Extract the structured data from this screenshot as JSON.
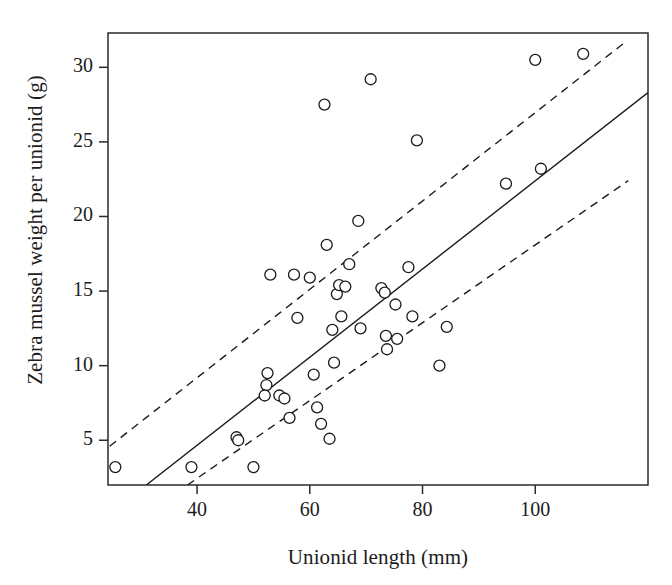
{
  "chart_data": {
    "type": "scatter",
    "title": "",
    "xlabel": "Unionid length (mm)",
    "ylabel": "Zebra mussel weight per unionid (g)",
    "xlim": [
      24.2,
      120.0
    ],
    "ylim": [
      2.0,
      32.3
    ],
    "xticks": [
      40,
      60,
      80,
      100
    ],
    "yticks": [
      5,
      10,
      15,
      20,
      25,
      30
    ],
    "xtick_labels": [
      "40",
      "60",
      "80",
      "100"
    ],
    "ytick_labels": [
      "5",
      "10",
      "15",
      "20",
      "25",
      "30"
    ],
    "grid": false,
    "legend": "none",
    "marker": {
      "shape": "circle",
      "fill": "#ffffff",
      "edge": "#1a1a1a",
      "size_px": 11,
      "edge_width": 1.3
    },
    "points": [
      {
        "x": 25.5,
        "y": 3.2
      },
      {
        "x": 39.0,
        "y": 3.2
      },
      {
        "x": 47.0,
        "y": 5.2
      },
      {
        "x": 47.3,
        "y": 5.0
      },
      {
        "x": 50.0,
        "y": 3.2
      },
      {
        "x": 52.5,
        "y": 9.5
      },
      {
        "x": 52.3,
        "y": 8.7
      },
      {
        "x": 52.0,
        "y": 8.0
      },
      {
        "x": 53.0,
        "y": 16.1
      },
      {
        "x": 54.6,
        "y": 8.0
      },
      {
        "x": 55.5,
        "y": 7.8
      },
      {
        "x": 56.4,
        "y": 6.5
      },
      {
        "x": 57.2,
        "y": 16.1
      },
      {
        "x": 57.8,
        "y": 13.2
      },
      {
        "x": 60.0,
        "y": 15.9
      },
      {
        "x": 60.7,
        "y": 9.4
      },
      {
        "x": 61.3,
        "y": 7.2
      },
      {
        "x": 62.0,
        "y": 6.1
      },
      {
        "x": 62.6,
        "y": 27.5
      },
      {
        "x": 63.0,
        "y": 18.1
      },
      {
        "x": 63.5,
        "y": 5.1
      },
      {
        "x": 64.0,
        "y": 12.4
      },
      {
        "x": 64.3,
        "y": 10.2
      },
      {
        "x": 64.8,
        "y": 14.8
      },
      {
        "x": 65.2,
        "y": 15.4
      },
      {
        "x": 65.6,
        "y": 13.3
      },
      {
        "x": 66.3,
        "y": 15.3
      },
      {
        "x": 67.0,
        "y": 16.8
      },
      {
        "x": 68.6,
        "y": 19.7
      },
      {
        "x": 69.0,
        "y": 12.5
      },
      {
        "x": 70.8,
        "y": 29.2
      },
      {
        "x": 72.7,
        "y": 15.2
      },
      {
        "x": 73.3,
        "y": 14.9
      },
      {
        "x": 73.5,
        "y": 12.0
      },
      {
        "x": 73.7,
        "y": 11.1
      },
      {
        "x": 75.2,
        "y": 14.1
      },
      {
        "x": 75.5,
        "y": 11.8
      },
      {
        "x": 77.5,
        "y": 16.6
      },
      {
        "x": 78.2,
        "y": 13.3
      },
      {
        "x": 79.0,
        "y": 25.1
      },
      {
        "x": 83.0,
        "y": 10.0
      },
      {
        "x": 84.3,
        "y": 12.6
      },
      {
        "x": 94.8,
        "y": 22.2
      },
      {
        "x": 100.0,
        "y": 30.5
      },
      {
        "x": 101.0,
        "y": 23.2
      },
      {
        "x": 108.5,
        "y": 30.9
      }
    ],
    "fit_line": {
      "style": "solid",
      "color": "#1a1a1a",
      "width": 1.4,
      "x0": 31.0,
      "y0": 2.0,
      "x1": 120.0,
      "y1": 28.3
    },
    "confidence_bands": [
      {
        "name": "upper",
        "style": "dashed",
        "color": "#1a1a1a",
        "width": 1.4,
        "dash": "8,6",
        "x0": 24.5,
        "y0": 4.6,
        "x1": 116.0,
        "y1": 31.7
      },
      {
        "name": "lower",
        "style": "dashed",
        "color": "#1a1a1a",
        "width": 1.4,
        "dash": "8,6",
        "x0": 38.3,
        "y0": 2.0,
        "x1": 116.5,
        "y1": 22.4
      }
    ],
    "frame": {
      "color": "#2b2b2b",
      "width": 1.5,
      "left_px": 108,
      "top_px": 33,
      "right_px": 648,
      "bottom_px": 485
    }
  }
}
